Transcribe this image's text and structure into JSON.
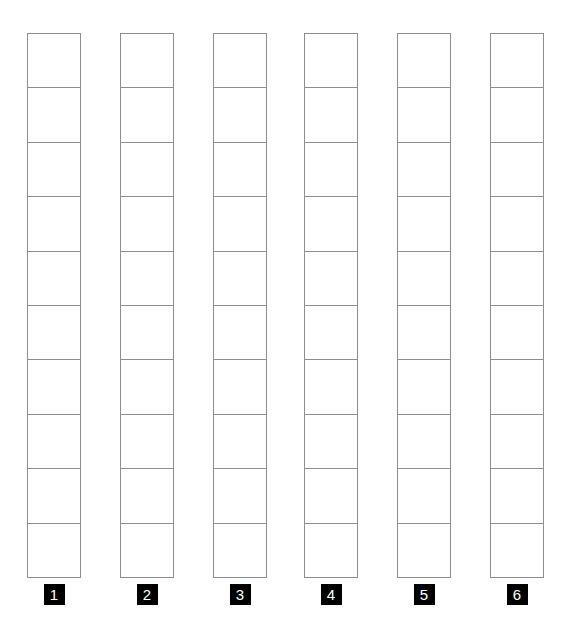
{
  "page": {
    "background_color": "#ffffff"
  },
  "grid": {
    "line_color": "#8e8e8e",
    "cells_per_column": 10,
    "column_count": 6
  },
  "labels": {
    "background_color": "#000000",
    "text_color": "#ffffff"
  },
  "columns": [
    {
      "label": "1",
      "cells": 10
    },
    {
      "label": "2",
      "cells": 10
    },
    {
      "label": "3",
      "cells": 10
    },
    {
      "label": "4",
      "cells": 10
    },
    {
      "label": "5",
      "cells": 10
    },
    {
      "label": "6",
      "cells": 10
    }
  ]
}
